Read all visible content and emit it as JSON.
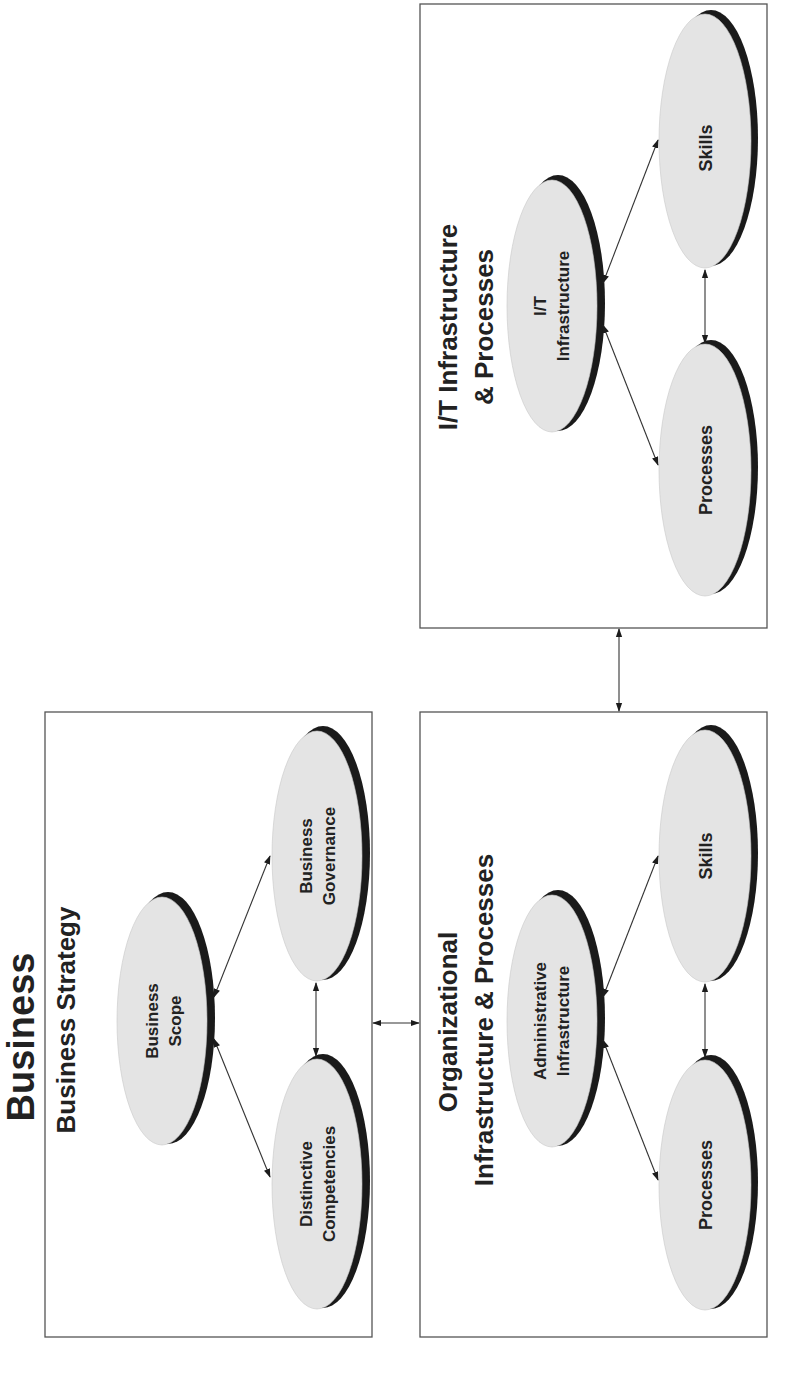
{
  "title": "Business",
  "colors": {
    "box_border": "#555555",
    "oval_fill": "#e4e4e4",
    "oval_shadow": "#1a1a1a",
    "text": "#222222",
    "background": "#ffffff"
  },
  "orientation": "rotated -90deg (text reads bottom-to-top)",
  "panels": {
    "business_strategy": {
      "title": "Business Strategy",
      "nodes": {
        "scope": {
          "line1": "Business",
          "line2": "Scope"
        },
        "governance": {
          "line1": "Business",
          "line2": "Governance"
        },
        "competencies": {
          "line1": "Distinctive",
          "line2": "Competencies"
        }
      }
    },
    "organizational": {
      "title_line1": "Organizational",
      "title_line2": "Infrastructure & Processes",
      "nodes": {
        "admin": {
          "line1": "Administrative",
          "line2": "Infrastructure"
        },
        "skills": {
          "line1": "Skills"
        },
        "processes": {
          "line1": "Processes"
        }
      }
    },
    "it": {
      "title_line1": "I/T Infrastructure",
      "title_line2": "& Processes",
      "nodes": {
        "infra": {
          "line1": "I/T",
          "line2": "Infrastructure"
        },
        "skills": {
          "line1": "Skills"
        },
        "processes": {
          "line1": "Processes"
        }
      }
    }
  },
  "connections": [
    {
      "from": "Business Scope",
      "to": "Business Governance",
      "type": "bidirectional"
    },
    {
      "from": "Business Scope",
      "to": "Distinctive Competencies",
      "type": "bidirectional"
    },
    {
      "from": "Business Governance",
      "to": "Distinctive Competencies",
      "type": "bidirectional"
    },
    {
      "from": "Administrative Infrastructure",
      "to": "Skills",
      "type": "bidirectional"
    },
    {
      "from": "Administrative Infrastructure",
      "to": "Processes",
      "type": "bidirectional"
    },
    {
      "from": "Skills",
      "to": "Processes",
      "type": "bidirectional"
    },
    {
      "from": "I/T Infrastructure",
      "to": "Skills",
      "type": "bidirectional"
    },
    {
      "from": "I/T Infrastructure",
      "to": "Processes",
      "type": "bidirectional"
    },
    {
      "from": "Skills",
      "to": "Processes",
      "type": "bidirectional"
    },
    {
      "from": "Business Strategy",
      "to": "Organizational Infrastructure & Processes",
      "type": "bidirectional"
    },
    {
      "from": "I/T Infrastructure & Processes",
      "to": "Organizational Infrastructure & Processes",
      "type": "bidirectional"
    }
  ]
}
